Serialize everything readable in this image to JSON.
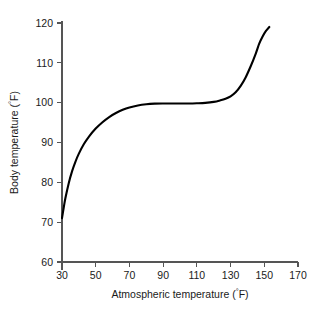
{
  "chart_data": {
    "type": "line",
    "title": "",
    "subtitle": "",
    "xlabel": "Atmospheric temperature (°F)",
    "ylabel": "Body temperature (°F)",
    "xlabel_main": "Atmospheric temperature (",
    "xlabel_deg": "°",
    "xlabel_tail": "F)",
    "ylabel_main": "Body temperature (",
    "ylabel_deg": "°",
    "ylabel_tail": "F)",
    "xlim": [
      30,
      170
    ],
    "ylim": [
      60,
      120
    ],
    "xticks": [
      30,
      50,
      70,
      90,
      110,
      130,
      150,
      170
    ],
    "yticks": [
      60,
      70,
      80,
      90,
      100,
      110,
      120
    ],
    "xtick_labels": [
      "30",
      "50",
      "70",
      "90",
      "110",
      "130",
      "150",
      "170"
    ],
    "ytick_labels": [
      "60",
      "70",
      "80",
      "90",
      "100",
      "110",
      "120"
    ],
    "grid": false,
    "legend": null,
    "series": [
      {
        "name": "body temperature response",
        "color": "#000000",
        "x": [
          30,
          31,
          32,
          34,
          36,
          38,
          40,
          43,
          46,
          50,
          54,
          58,
          62,
          66,
          70,
          75,
          80,
          85,
          90,
          95,
          100,
          105,
          110,
          115,
          120,
          124,
          127,
          130,
          133,
          136,
          139,
          142,
          145,
          147,
          149,
          151,
          153
        ],
        "y": [
          71.0,
          73.6,
          76.0,
          79.8,
          82.8,
          85.2,
          87.2,
          89.6,
          91.5,
          93.5,
          95.1,
          96.4,
          97.4,
          98.2,
          98.8,
          99.3,
          99.6,
          99.75,
          99.8,
          99.8,
          99.8,
          99.8,
          99.85,
          99.95,
          100.2,
          100.6,
          101.0,
          101.6,
          102.6,
          104.2,
          106.4,
          109.2,
          112.4,
          114.8,
          116.6,
          118.0,
          119.0
        ]
      }
    ]
  },
  "geometry": {
    "plot_left": 62,
    "plot_right": 298,
    "plot_top": 23,
    "plot_bottom": 262,
    "axis_bottom_overshoot": 8
  }
}
